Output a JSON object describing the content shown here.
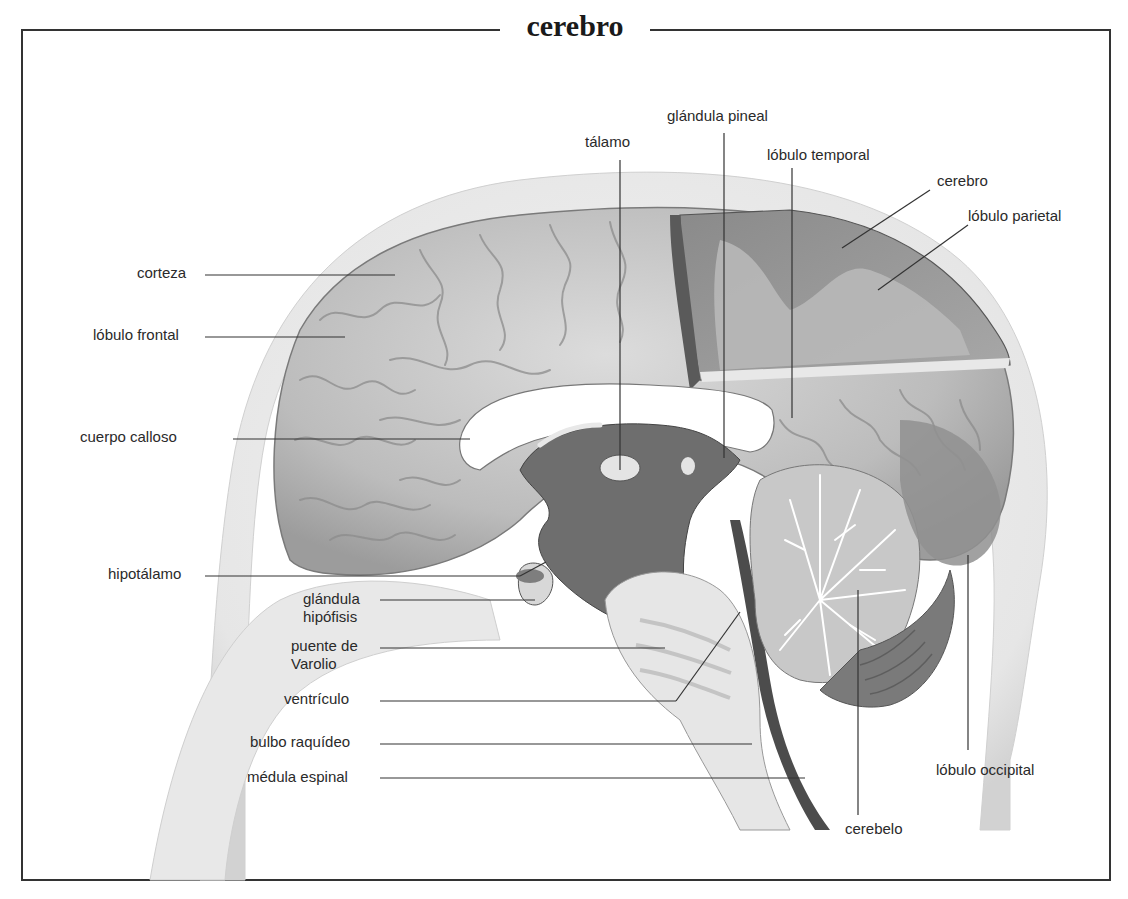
{
  "title": "cerebro",
  "diagram": {
    "labels": {
      "talamo": "tálamo",
      "glandula_pineal": "glándula pineal",
      "lobulo_temporal": "lóbulo temporal",
      "cerebro": "cerebro",
      "lobulo_parietal": "lóbulo parietal",
      "corteza": "corteza",
      "lobulo_frontal": "lóbulo frontal",
      "cuerpo_calloso": "cuerpo calloso",
      "hipotalamo": "hipotálamo",
      "glandula_hipofisis_1": "glándula",
      "glandula_hipofisis_2": "hipófisis",
      "puente_varolio_1": "puente de",
      "puente_varolio_2": "Varolio",
      "ventriculo": "ventrículo",
      "bulbo_raquideo": "bulbo raquídeo",
      "medula_espinal": "médula espinal",
      "lobulo_occipital": "lóbulo occipital",
      "cerebelo": "cerebelo"
    }
  },
  "colors": {
    "frame": "#333333",
    "leader_line": "#333333",
    "brain_surface": "#c8c8c8",
    "cut_section": "#9a9a9a",
    "dark_interior": "#6e6e6e",
    "head_outline": "#e2e2e2"
  }
}
